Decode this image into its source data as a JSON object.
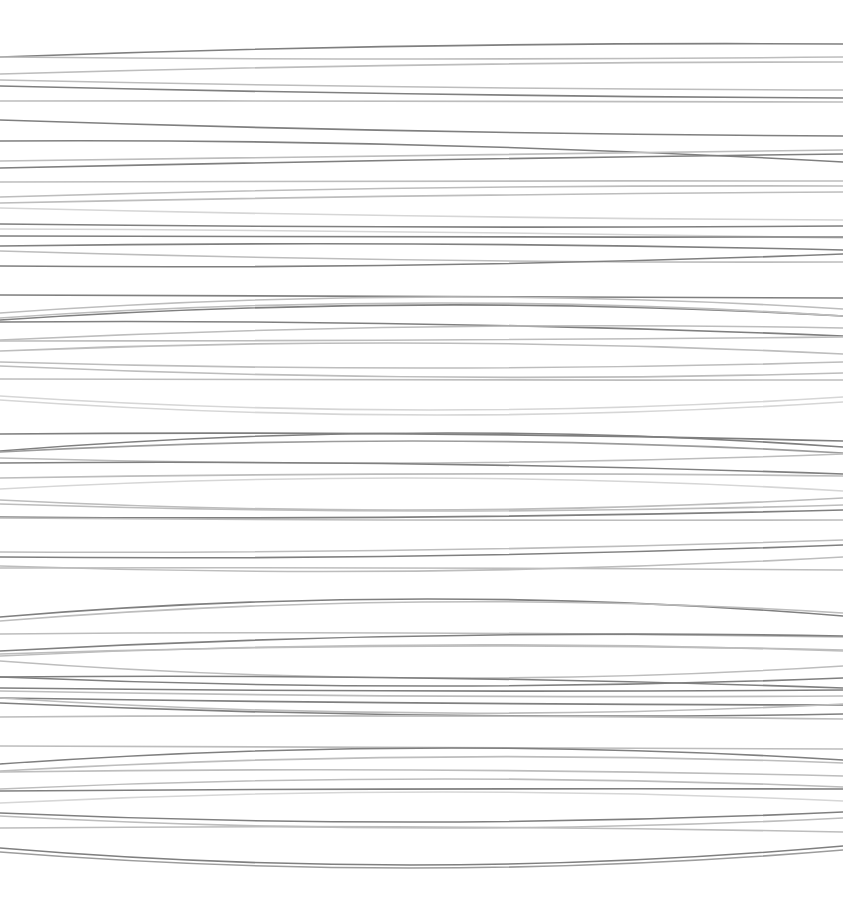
{
  "artwork": {
    "width": 843,
    "height": 905,
    "background": "#ffffff",
    "shades": {
      "dark": "#7f7f7f",
      "mid": "#9c9c9c",
      "light": "#bdbdbd",
      "faint": "#d6d6d6"
    },
    "stroke_width": 1.6,
    "lines": [
      {
        "l": 57,
        "m": 46,
        "r": 44,
        "s": "dark"
      },
      {
        "l": 57,
        "m": 59,
        "r": 57,
        "s": "light"
      },
      {
        "l": 74,
        "m": 65,
        "r": 62,
        "s": "light"
      },
      {
        "l": 80,
        "m": 87,
        "r": 90,
        "s": "light"
      },
      {
        "l": 86,
        "m": 94,
        "r": 98,
        "s": "dark"
      },
      {
        "l": 101,
        "m": 101,
        "r": 102,
        "s": "light"
      },
      {
        "l": 120,
        "m": 131,
        "r": 136,
        "s": "dark"
      },
      {
        "l": 141,
        "m": 145,
        "r": 162,
        "s": "dark"
      },
      {
        "l": 161,
        "m": 155,
        "r": 150,
        "s": "light"
      },
      {
        "l": 168,
        "m": 160,
        "r": 154,
        "s": "dark"
      },
      {
        "l": 182,
        "m": 181,
        "r": 181,
        "s": "light"
      },
      {
        "l": 197,
        "m": 188,
        "r": 186,
        "s": "light"
      },
      {
        "l": 203,
        "m": 196,
        "r": 192,
        "s": "light"
      },
      {
        "l": 208,
        "m": 216,
        "r": 220,
        "s": "faint"
      },
      {
        "l": 224,
        "m": 227,
        "r": 226,
        "s": "dark"
      },
      {
        "l": 229,
        "m": 232,
        "r": 238,
        "s": "faint"
      },
      {
        "l": 236,
        "m": 237,
        "r": 237,
        "s": "dark"
      },
      {
        "l": 246,
        "m": 244,
        "r": 250,
        "s": "dark"
      },
      {
        "l": 251,
        "m": 260,
        "r": 262,
        "s": "light"
      },
      {
        "l": 266,
        "m": 265,
        "r": 254,
        "s": "dark"
      },
      {
        "l": 295,
        "m": 297,
        "r": 298,
        "s": "dark"
      },
      {
        "l": 313,
        "m": 297,
        "r": 309,
        "s": "light"
      },
      {
        "l": 320,
        "m": 305,
        "r": 316,
        "s": "dark"
      },
      {
        "l": 318,
        "m": 303,
        "r": 316,
        "s": "light"
      },
      {
        "l": 322,
        "m": 324,
        "r": 336,
        "s": "dark"
      },
      {
        "l": 340,
        "m": 327,
        "r": 328,
        "s": "light"
      },
      {
        "l": 341,
        "m": 340,
        "r": 337,
        "s": "light"
      },
      {
        "l": 351,
        "m": 343,
        "r": 354,
        "s": "light"
      },
      {
        "l": 362,
        "m": 368,
        "r": 362,
        "s": "light"
      },
      {
        "l": 366,
        "m": 377,
        "r": 373,
        "s": "light"
      },
      {
        "l": 379,
        "m": 380,
        "r": 380,
        "s": "light"
      },
      {
        "l": 396,
        "m": 410,
        "r": 397,
        "s": "faint"
      },
      {
        "l": 400,
        "m": 415,
        "r": 402,
        "s": "faint"
      },
      {
        "l": 434,
        "m": 434,
        "r": 441,
        "s": "dark"
      },
      {
        "l": 451,
        "m": 433,
        "r": 447,
        "s": "dark"
      },
      {
        "l": 452,
        "m": 441,
        "r": 453,
        "s": "mid"
      },
      {
        "l": 458,
        "m": 463,
        "r": 454,
        "s": "light"
      },
      {
        "l": 463,
        "m": 464,
        "r": 474,
        "s": "dark"
      },
      {
        "l": 478,
        "m": 474,
        "r": 476,
        "s": "light"
      },
      {
        "l": 489,
        "m": 478,
        "r": 491,
        "s": "faint"
      },
      {
        "l": 500,
        "m": 510,
        "r": 498,
        "s": "light"
      },
      {
        "l": 504,
        "m": 511,
        "r": 505,
        "s": "light"
      },
      {
        "l": 517,
        "m": 517,
        "r": 510,
        "s": "dark"
      },
      {
        "l": 518,
        "m": 520,
        "r": 520,
        "s": "light"
      },
      {
        "l": 552,
        "m": 550,
        "r": 540,
        "s": "light"
      },
      {
        "l": 557,
        "m": 556,
        "r": 545,
        "s": "dark"
      },
      {
        "l": 566,
        "m": 571,
        "r": 557,
        "s": "light"
      },
      {
        "l": 568,
        "m": 568,
        "r": 570,
        "s": "light"
      },
      {
        "l": 617,
        "m": 599,
        "r": 616,
        "s": "dark"
      },
      {
        "l": 621,
        "m": 602,
        "r": 613,
        "s": "light"
      },
      {
        "l": 634,
        "m": 633,
        "r": 637,
        "s": "light"
      },
      {
        "l": 651,
        "m": 636,
        "r": 636,
        "s": "dark"
      },
      {
        "l": 654,
        "m": 646,
        "r": 650,
        "s": "light"
      },
      {
        "l": 656,
        "m": 645,
        "r": 651,
        "s": "light"
      },
      {
        "l": 661,
        "m": 678,
        "r": 666,
        "s": "light"
      },
      {
        "l": 677,
        "m": 678,
        "r": 688,
        "s": "dark"
      },
      {
        "l": 677,
        "m": 686,
        "r": 678,
        "s": "dark"
      },
      {
        "l": 688,
        "m": 691,
        "r": 690,
        "s": "dark"
      },
      {
        "l": 691,
        "m": 696,
        "r": 696,
        "s": "light"
      },
      {
        "l": 698,
        "m": 703,
        "r": 705,
        "s": "dark"
      },
      {
        "l": 698,
        "m": 713,
        "r": 704,
        "s": "light"
      },
      {
        "l": 703,
        "m": 715,
        "r": 714,
        "s": "dark"
      },
      {
        "l": 717,
        "m": 716,
        "r": 719,
        "s": "light"
      },
      {
        "l": 746,
        "m": 747,
        "r": 749,
        "s": "light"
      },
      {
        "l": 764,
        "m": 748,
        "r": 760,
        "s": "dark"
      },
      {
        "l": 771,
        "m": 757,
        "r": 763,
        "s": "light"
      },
      {
        "l": 772,
        "m": 770,
        "r": 776,
        "s": "light"
      },
      {
        "l": 789,
        "m": 779,
        "r": 787,
        "s": "light"
      },
      {
        "l": 791,
        "m": 789,
        "r": 789,
        "s": "dark"
      },
      {
        "l": 803,
        "m": 792,
        "r": 801,
        "s": "faint"
      },
      {
        "l": 813,
        "m": 822,
        "r": 812,
        "s": "dark"
      },
      {
        "l": 816,
        "m": 828,
        "r": 818,
        "s": "light"
      },
      {
        "l": 828,
        "m": 827,
        "r": 832,
        "s": "light"
      },
      {
        "l": 848,
        "m": 865,
        "r": 846,
        "s": "dark"
      },
      {
        "l": 852,
        "m": 868,
        "r": 850,
        "s": "mid"
      }
    ]
  }
}
